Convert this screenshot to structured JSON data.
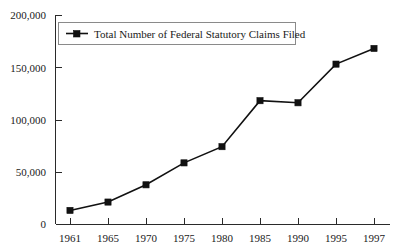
{
  "chart_data": {
    "type": "line",
    "title": "",
    "xlabel": "",
    "ylabel": "",
    "grid": false,
    "legend_position": "top-left-inside",
    "x": [
      "1961",
      "1965",
      "1970",
      "1975",
      "1980",
      "1985",
      "1990",
      "1995",
      "1997"
    ],
    "categories": [
      "1961",
      "1965",
      "1970",
      "1975",
      "1980",
      "1985",
      "1990",
      "1995",
      "1997"
    ],
    "xtick_labels": [
      "1961",
      "1965",
      "1970",
      "1975",
      "1980",
      "1985",
      "1990",
      "1995",
      "1997"
    ],
    "ytick_labels": [
      "0",
      "50,000",
      "100,000",
      "150,000",
      "200,000"
    ],
    "ytick_values": [
      0,
      50000,
      100000,
      150000,
      200000
    ],
    "ylim": [
      0,
      200000
    ],
    "marker": "square",
    "line_color": "#111111",
    "marker_color": "#111111",
    "series": [
      {
        "name": "Total Number of Federal Statutory Claims Filed",
        "values": [
          13000,
          21000,
          37500,
          58500,
          74000,
          118000,
          116000,
          153000,
          168000
        ]
      }
    ]
  },
  "legend": {
    "entries": [
      {
        "label": "Total Number of Federal Statutory Claims Filed",
        "marker": "square",
        "color": "#111111"
      }
    ]
  },
  "axes": {
    "y_labels": [
      "200,000",
      "150,000",
      "100,000",
      "50,000",
      "0"
    ],
    "x_labels": [
      "1961",
      "1965",
      "1970",
      "1975",
      "1980",
      "1985",
      "1990",
      "1995",
      "1997"
    ]
  }
}
